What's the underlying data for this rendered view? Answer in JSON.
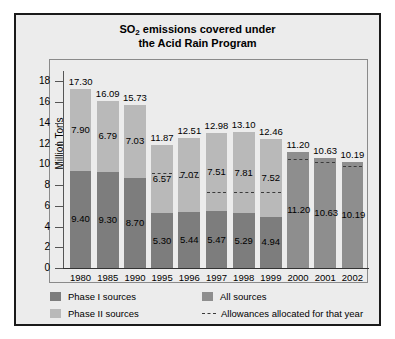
{
  "chart_data": {
    "type": "bar",
    "title": "SO2 emissions covered under the Acid Rain Program",
    "title_line1_pre": "SO",
    "title_line1_sub": "2",
    "title_line1_post": " emissions covered under",
    "title_line2": "the Acid Rain Program",
    "xlabel": "",
    "ylabel": "Million Tons",
    "ylim": [
      0,
      19
    ],
    "yticks": [
      0,
      2,
      4,
      6,
      8,
      10,
      12,
      14,
      16,
      18
    ],
    "grid": false,
    "stacked": true,
    "legend_position": "bottom-left",
    "categories": [
      "1980",
      "1985",
      "1990",
      "1995",
      "1996",
      "1997",
      "1998",
      "1999",
      "2000",
      "2001",
      "2002"
    ],
    "series": [
      {
        "name": "Phase I sources",
        "color": "#7d7d7d",
        "values": [
          9.4,
          9.3,
          8.7,
          5.3,
          5.44,
          5.47,
          5.29,
          4.94,
          null,
          null,
          null
        ]
      },
      {
        "name": "Phase II sources",
        "color": "#b9b9b9",
        "values": [
          7.9,
          6.79,
          7.03,
          6.57,
          7.07,
          7.51,
          7.81,
          7.52,
          null,
          null,
          null
        ]
      },
      {
        "name": "All sources",
        "color": "#8e8e8e",
        "values": [
          null,
          null,
          null,
          null,
          null,
          null,
          null,
          null,
          11.2,
          10.63,
          10.19
        ]
      }
    ],
    "totals": [
      17.3,
      16.09,
      15.73,
      11.87,
      12.51,
      12.98,
      13.1,
      12.46,
      11.2,
      10.63,
      10.19
    ],
    "total_labels": [
      "17.30",
      "16.09",
      "15.73",
      "11.87",
      "12.51",
      "12.98",
      "13.10",
      "12.46",
      "11.20",
      "10.63",
      "10.19"
    ],
    "allowances": {
      "name": "Allowances allocated for that year",
      "values": [
        null,
        null,
        null,
        9.15,
        8.75,
        7.35,
        7.35,
        7.35,
        10.55,
        10.2,
        9.8
      ]
    }
  },
  "legend": {
    "items": [
      {
        "label": "Phase I sources",
        "color": "#7d7d7d",
        "kind": "swatch"
      },
      {
        "label": "All sources",
        "color": "#8e8e8e",
        "kind": "swatch"
      },
      {
        "label": "Phase II sources",
        "color": "#b9b9b9",
        "kind": "swatch"
      },
      {
        "label": "Allowances allocated for that year",
        "color": "#3a3a3a",
        "kind": "dash"
      }
    ]
  },
  "axis": {
    "y_title": "Million Tons",
    "y_tick_labels": [
      "18",
      "16",
      "14",
      "12",
      "10",
      "8",
      "6",
      "4",
      "2",
      "0"
    ],
    "x_tick_labels": [
      "1980",
      "1985",
      "1990",
      "1995",
      "1996",
      "1997",
      "1998",
      "1999",
      "2000",
      "2001",
      "2002"
    ]
  },
  "series_labels": {
    "phase1": [
      "9.40",
      "9.30",
      "8.70",
      "5.30",
      "5.44",
      "5.47",
      "5.29",
      "4.94"
    ],
    "phase2": [
      "7.90",
      "6.79",
      "7.03",
      "6.57",
      "7.07",
      "7.51",
      "7.81",
      "7.52"
    ],
    "all": [
      "11.20",
      "10.63",
      "10.19"
    ]
  }
}
